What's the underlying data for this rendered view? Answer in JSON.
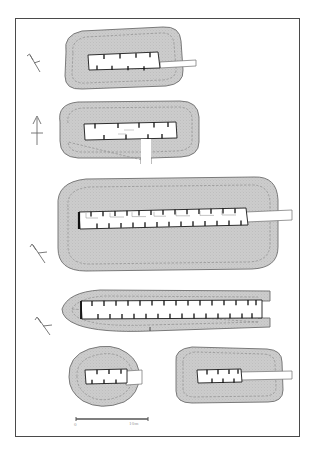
{
  "figure": {
    "type": "archaeological-site-plan",
    "frame": {
      "border_color": "#4a4a4a",
      "background": "#ffffff"
    },
    "colors": {
      "bank_fill": "#c8c8c8",
      "bank_outline": "#6e6e6e",
      "inner_ditch_line": "#8a8a8a",
      "building_fill": "#ffffff",
      "building_outline": "#1a1a1a",
      "wall_stub": "#111111",
      "arrow": "#6b6b6b",
      "scale_line": "#555555",
      "label_text": "#9a9a9a"
    }
  },
  "scale_bar": {
    "name": "scale-bar",
    "start_label": "0",
    "end_label": "10m",
    "unit": "m",
    "length_value": 10,
    "pixel_length": 72
  },
  "north_arrows": [
    {
      "id": "north-arrow-1",
      "direction": "up-left",
      "rotation_deg": -32,
      "for_plan": "plan-1"
    },
    {
      "id": "north-arrow-2",
      "direction": "up",
      "rotation_deg": 0,
      "for_plan": "plan-2"
    },
    {
      "id": "north-arrow-3",
      "direction": "up-left",
      "rotation_deg": -38,
      "for_plan": "plan-3"
    },
    {
      "id": "north-arrow-4",
      "direction": "up-left",
      "rotation_deg": -35,
      "for_plan": "plan-4"
    }
  ],
  "plans": [
    {
      "id": "plan-1",
      "name": "enclosure-plan-1",
      "shape": "rounded-rectangle",
      "entrance_side": "east",
      "building": {
        "divisions": 4,
        "wall_stubs_top": 4,
        "wall_stubs_bottom": 4
      }
    },
    {
      "id": "plan-2",
      "name": "enclosure-plan-2",
      "shape": "rounded-rectangle",
      "entrance_side": "south",
      "building": {
        "divisions": 5,
        "wall_stubs_top": 5,
        "wall_stubs_bottom": 4
      }
    },
    {
      "id": "plan-3",
      "name": "enclosure-plan-3",
      "shape": "large-rounded-rectangle",
      "entrance_side": "east",
      "building": {
        "divisions": 14,
        "wall_stubs_top": 13,
        "wall_stubs_bottom": 13
      }
    },
    {
      "id": "plan-4",
      "name": "enclosure-plan-4",
      "shape": "elongated-boat",
      "entrance_side": "east",
      "building": {
        "divisions": 16,
        "wall_stubs_top": 15,
        "wall_stubs_bottom": 15
      }
    },
    {
      "id": "plan-5",
      "name": "enclosure-plan-5",
      "shape": "circular",
      "entrance_side": "east",
      "building": {
        "divisions": 3,
        "wall_stubs_top": 3,
        "wall_stubs_bottom": 3
      }
    },
    {
      "id": "plan-6",
      "name": "enclosure-plan-6",
      "shape": "rounded-rectangle",
      "entrance_side": "east",
      "building": {
        "divisions": 4,
        "wall_stubs_top": 4,
        "wall_stubs_bottom": 3
      }
    }
  ]
}
